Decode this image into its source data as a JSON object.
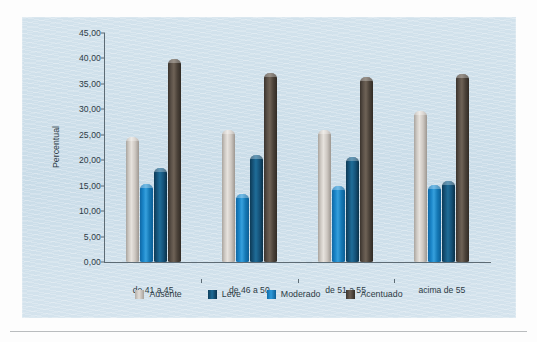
{
  "chart_data": {
    "type": "bar",
    "title": "",
    "xlabel": "",
    "ylabel": "Percentual",
    "ylim": [
      0,
      45
    ],
    "ytick_step": 5,
    "ytick_labels": [
      "0,00",
      "5,00",
      "10,00",
      "15,00",
      "20,00",
      "25,00",
      "30,00",
      "35,00",
      "40,00",
      "45,00"
    ],
    "ytick_values": [
      0,
      5,
      10,
      15,
      20,
      25,
      30,
      35,
      40,
      45
    ],
    "grid": false,
    "legend_position": "bottom",
    "categories": [
      "de 41 a 45",
      "de 46 a 50",
      "de 51 a 55",
      "acima de 55"
    ],
    "series": [
      {
        "name": "Ausente",
        "color": "#d8d3cd",
        "values": [
          24.5,
          26.0,
          26.0,
          29.7
        ]
      },
      {
        "name": "Moderado",
        "color": "#1b86c9",
        "values": [
          15.4,
          13.3,
          14.9,
          15.1
        ]
      },
      {
        "name": "Leve",
        "color": "#17567d",
        "values": [
          18.4,
          21.1,
          20.6,
          16.0
        ]
      },
      {
        "name": "Acentuado",
        "color": "#5b5148",
        "values": [
          39.8,
          37.2,
          36.3,
          37.0
        ]
      }
    ],
    "legend_order": [
      "Ausente",
      "Leve",
      "Moderado",
      "Acentuado"
    ],
    "bar_draw_order": [
      "Ausente",
      "Moderado",
      "Leve",
      "Acentuado"
    ]
  },
  "legend": {
    "items": [
      {
        "label": "Ausente",
        "key": "ausente"
      },
      {
        "label": "Leve",
        "key": "leve"
      },
      {
        "label": "Moderado",
        "key": "moderado"
      },
      {
        "label": "Acentuado",
        "key": "acentuado"
      }
    ]
  }
}
